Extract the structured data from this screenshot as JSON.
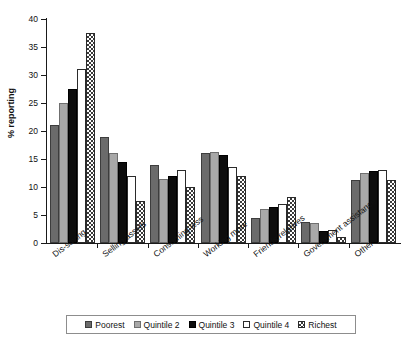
{
  "chart_data": {
    "type": "bar",
    "title": "",
    "xlabel": "",
    "ylabel": "% reporting",
    "ylim": [
      0,
      40
    ],
    "yticks": [
      0,
      5,
      10,
      15,
      20,
      25,
      30,
      35,
      40
    ],
    "ytick_labels": [
      "0",
      "5",
      "10",
      "15",
      "20",
      "25",
      "30",
      "35",
      "40"
    ],
    "grid": false,
    "legend_position": "bottom",
    "categories": [
      "Dis-saving",
      "Selling assets",
      "Consuming less",
      "Working more",
      "Friends/relatives",
      "Government assistance",
      "Other"
    ],
    "series": [
      {
        "name": "Poorest",
        "color": "#6b6b6b",
        "pattern": "solid-dark-gray",
        "values": [
          21.0,
          18.9,
          14.0,
          16.0,
          4.5,
          3.8,
          11.3
        ]
      },
      {
        "name": "Quintile 2",
        "color": "#a8a8a8",
        "pattern": "solid-light-gray",
        "values": [
          25.0,
          16.0,
          11.5,
          16.3,
          6.0,
          3.5,
          12.5
        ]
      },
      {
        "name": "Quintile 3",
        "color": "#0d0d0d",
        "pattern": "solid-black",
        "values": [
          27.5,
          14.5,
          12.0,
          15.8,
          6.5,
          2.2,
          12.8
        ]
      },
      {
        "name": "Quintile 4",
        "color": "#ffffff",
        "pattern": "open-white",
        "values": [
          31.0,
          12.0,
          13.0,
          13.5,
          7.0,
          2.3,
          13.0
        ]
      },
      {
        "name": "Richest",
        "color": "#ffffff",
        "pattern": "checkered",
        "values": [
          37.5,
          7.5,
          10.0,
          12.0,
          8.2,
          1.0,
          11.3
        ]
      }
    ]
  },
  "legend": {
    "items": [
      {
        "label": "Poorest",
        "swatch": "legend-swatch-poorest"
      },
      {
        "label": "Quintile 2",
        "swatch": "legend-swatch-quintile-2"
      },
      {
        "label": "Quintile 3",
        "swatch": "legend-swatch-quintile-3"
      },
      {
        "label": "Quintile 4",
        "swatch": "legend-swatch-quintile-4"
      },
      {
        "label": "Richest",
        "swatch": "legend-swatch-richest"
      }
    ]
  }
}
